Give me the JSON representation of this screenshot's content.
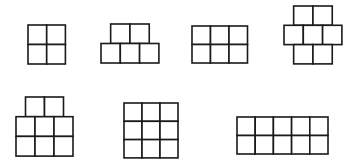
{
  "title": "",
  "figures": [
    {
      "id": "figure-1",
      "description": "2x2 square",
      "rows": [
        {
          "cells": 2,
          "offset": 0
        },
        {
          "cells": 2,
          "offset": 0
        }
      ]
    },
    {
      "id": "figure-2",
      "description": "2 on top of 3",
      "rows": [
        {
          "cells": 2,
          "offset": 0.5
        },
        {
          "cells": 3,
          "offset": 0
        }
      ]
    },
    {
      "id": "figure-3",
      "description": "3x2 rectangle",
      "rows": [
        {
          "cells": 3,
          "offset": 0
        },
        {
          "cells": 3,
          "offset": 0
        }
      ]
    },
    {
      "id": "figure-4",
      "description": "2-3-2 staggered",
      "rows": [
        {
          "cells": 2,
          "offset": 0.5
        },
        {
          "cells": 3,
          "offset": 0
        },
        {
          "cells": 2,
          "offset": 0.5
        }
      ]
    },
    {
      "id": "figure-5",
      "description": "2 on top of 3x2",
      "rows": [
        {
          "cells": 2,
          "offset": 0.5
        },
        {
          "cells": 3,
          "offset": 0
        },
        {
          "cells": 3,
          "offset": 0
        }
      ]
    },
    {
      "id": "figure-6",
      "description": "3x3 square",
      "rows": [
        {
          "cells": 3,
          "offset": 0
        },
        {
          "cells": 3,
          "offset": 0
        },
        {
          "cells": 3,
          "offset": 0
        }
      ]
    },
    {
      "id": "figure-7",
      "description": "5x2 rectangle",
      "rows": [
        {
          "cells": 5,
          "offset": 0
        },
        {
          "cells": 5,
          "offset": 0
        }
      ]
    }
  ],
  "colors": {
    "stroke": "#1a1a1a",
    "fill": "#ffffff",
    "background": "#ffffff"
  }
}
